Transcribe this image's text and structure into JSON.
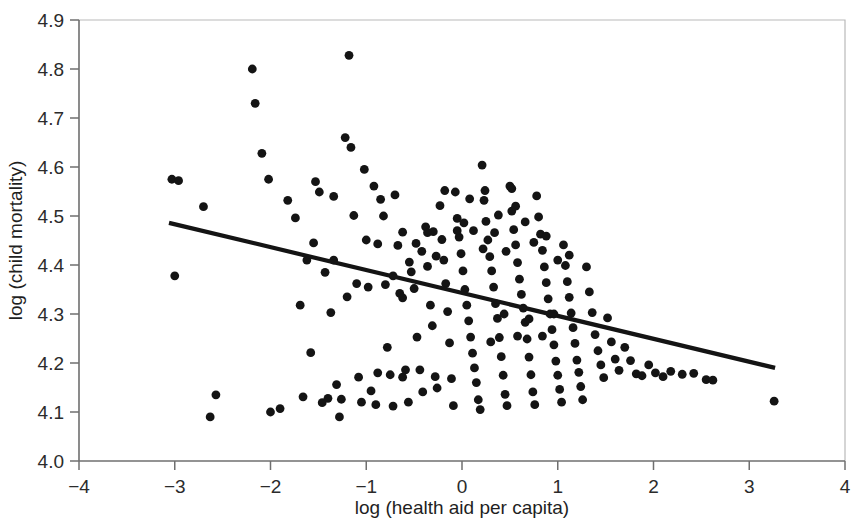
{
  "chart_data": {
    "type": "scatter",
    "title": "",
    "xlabel": "log (health aid per capita)",
    "ylabel": "log (child mortality)",
    "xlim": [
      -4,
      4
    ],
    "ylim": [
      4.0,
      4.9
    ],
    "xticks": [
      -4,
      -3,
      -2,
      -1,
      0,
      1,
      2,
      3,
      4
    ],
    "xtick_labels": [
      "−4",
      "−3",
      "−2",
      "−1",
      "0",
      "1",
      "2",
      "3",
      "4"
    ],
    "yticks": [
      4.0,
      4.1,
      4.2,
      4.3,
      4.4,
      4.5,
      4.6,
      4.7,
      4.8,
      4.9
    ],
    "ytick_labels": [
      "4.0",
      "4.1",
      "4.2",
      "4.3",
      "4.4",
      "4.5",
      "4.6",
      "4.7",
      "4.8",
      "4.9"
    ],
    "grid": false,
    "legend": null,
    "point_color": "#141414",
    "point_radius": 4.4,
    "fit_line": {
      "label": "linear fit",
      "color": "#141414",
      "x_start": -3.06,
      "y_start": 4.486,
      "x_end": 3.27,
      "y_end": 4.19,
      "slope": -0.0467,
      "intercept": 4.3432
    },
    "series": [
      {
        "name": "countries",
        "n_points": 196,
        "points": [
          [
            -3.03,
            4.575
          ],
          [
            -2.96,
            4.572
          ],
          [
            -3.0,
            4.378
          ],
          [
            -2.7,
            4.519
          ],
          [
            -2.63,
            4.09
          ],
          [
            -2.57,
            4.135
          ],
          [
            -2.19,
            4.8
          ],
          [
            -2.16,
            4.73
          ],
          [
            -2.09,
            4.628
          ],
          [
            -2.02,
            4.575
          ],
          [
            -2.0,
            4.1
          ],
          [
            -1.9,
            4.107
          ],
          [
            -1.82,
            4.532
          ],
          [
            -1.74,
            4.496
          ],
          [
            -1.69,
            4.318
          ],
          [
            -1.66,
            4.131
          ],
          [
            -1.62,
            4.41
          ],
          [
            -1.58,
            4.221
          ],
          [
            -1.53,
            4.57
          ],
          [
            -1.49,
            4.549
          ],
          [
            -1.46,
            4.119
          ],
          [
            -1.43,
            4.385
          ],
          [
            -1.4,
            4.128
          ],
          [
            -1.37,
            4.303
          ],
          [
            -1.34,
            4.54
          ],
          [
            -1.31,
            4.156
          ],
          [
            -1.28,
            4.09
          ],
          [
            -1.26,
            4.126
          ],
          [
            -1.22,
            4.66
          ],
          [
            -1.18,
            4.828
          ],
          [
            -1.16,
            4.64
          ],
          [
            -1.13,
            4.501
          ],
          [
            -1.1,
            4.362
          ],
          [
            -1.08,
            4.171
          ],
          [
            -1.05,
            4.12
          ],
          [
            -1.02,
            4.595
          ],
          [
            -1.0,
            4.451
          ],
          [
            -0.98,
            4.355
          ],
          [
            -0.95,
            4.143
          ],
          [
            -0.92,
            4.561
          ],
          [
            -0.9,
            4.115
          ],
          [
            -0.88,
            4.18
          ],
          [
            -0.85,
            4.534
          ],
          [
            -0.82,
            4.5
          ],
          [
            -0.8,
            4.36
          ],
          [
            -0.78,
            4.232
          ],
          [
            -0.75,
            4.176
          ],
          [
            -0.72,
            4.112
          ],
          [
            -0.7,
            4.543
          ],
          [
            -0.67,
            4.44
          ],
          [
            -0.65,
            4.342
          ],
          [
            -0.62,
            4.171
          ],
          [
            -0.59,
            4.186
          ],
          [
            -0.56,
            4.12
          ],
          [
            -0.53,
            4.386
          ],
          [
            -0.5,
            4.352
          ],
          [
            -0.47,
            4.253
          ],
          [
            -0.44,
            4.186
          ],
          [
            -0.41,
            4.141
          ],
          [
            -0.38,
            4.478
          ],
          [
            -0.36,
            4.397
          ],
          [
            -0.33,
            4.318
          ],
          [
            -0.31,
            4.276
          ],
          [
            -0.28,
            4.172
          ],
          [
            -0.26,
            4.149
          ],
          [
            -0.23,
            4.521
          ],
          [
            -0.21,
            4.452
          ],
          [
            -0.19,
            4.41
          ],
          [
            -0.17,
            4.362
          ],
          [
            -0.15,
            4.305
          ],
          [
            -0.13,
            4.241
          ],
          [
            -0.11,
            4.168
          ],
          [
            -0.09,
            4.113
          ],
          [
            -0.07,
            4.549
          ],
          [
            -0.05,
            4.495
          ],
          [
            -0.03,
            4.457
          ],
          [
            -0.01,
            4.423
          ],
          [
            0.01,
            4.388
          ],
          [
            0.03,
            4.35
          ],
          [
            0.05,
            4.318
          ],
          [
            0.07,
            4.286
          ],
          [
            0.09,
            4.253
          ],
          [
            0.11,
            4.22
          ],
          [
            0.13,
            4.19
          ],
          [
            0.15,
            4.16
          ],
          [
            0.17,
            4.125
          ],
          [
            0.19,
            4.105
          ],
          [
            0.21,
            4.604
          ],
          [
            0.23,
            4.532
          ],
          [
            0.25,
            4.489
          ],
          [
            0.27,
            4.451
          ],
          [
            0.29,
            4.417
          ],
          [
            0.31,
            4.388
          ],
          [
            0.33,
            4.355
          ],
          [
            0.35,
            4.321
          ],
          [
            0.37,
            4.291
          ],
          [
            0.39,
            4.252
          ],
          [
            0.41,
            4.213
          ],
          [
            0.43,
            4.175
          ],
          [
            0.45,
            4.136
          ],
          [
            0.47,
            4.113
          ],
          [
            0.5,
            4.561
          ],
          [
            0.52,
            4.51
          ],
          [
            0.54,
            4.472
          ],
          [
            0.56,
            4.441
          ],
          [
            0.58,
            4.405
          ],
          [
            0.6,
            4.371
          ],
          [
            0.62,
            4.34
          ],
          [
            0.64,
            4.312
          ],
          [
            0.66,
            4.283
          ],
          [
            0.68,
            4.249
          ],
          [
            0.7,
            4.212
          ],
          [
            0.72,
            4.176
          ],
          [
            0.74,
            4.141
          ],
          [
            0.76,
            4.115
          ],
          [
            0.78,
            4.541
          ],
          [
            0.8,
            4.498
          ],
          [
            0.82,
            4.463
          ],
          [
            0.84,
            4.43
          ],
          [
            0.86,
            4.396
          ],
          [
            0.88,
            4.364
          ],
          [
            0.9,
            4.331
          ],
          [
            0.92,
            4.3
          ],
          [
            0.94,
            4.268
          ],
          [
            0.96,
            4.237
          ],
          [
            0.98,
            4.204
          ],
          [
            1.0,
            4.175
          ],
          [
            1.02,
            4.146
          ],
          [
            1.04,
            4.12
          ],
          [
            1.06,
            4.441
          ],
          [
            1.08,
            4.399
          ],
          [
            1.1,
            4.366
          ],
          [
            1.12,
            4.334
          ],
          [
            1.14,
            4.302
          ],
          [
            1.16,
            4.272
          ],
          [
            1.18,
            4.24
          ],
          [
            1.2,
            4.206
          ],
          [
            1.22,
            4.181
          ],
          [
            1.24,
            4.152
          ],
          [
            1.26,
            4.125
          ],
          [
            1.3,
            4.396
          ],
          [
            1.33,
            4.345
          ],
          [
            1.36,
            4.303
          ],
          [
            1.39,
            4.258
          ],
          [
            1.42,
            4.225
          ],
          [
            1.45,
            4.196
          ],
          [
            1.48,
            4.17
          ],
          [
            1.52,
            4.292
          ],
          [
            1.56,
            4.243
          ],
          [
            1.6,
            4.208
          ],
          [
            1.64,
            4.185
          ],
          [
            1.7,
            4.232
          ],
          [
            1.76,
            4.205
          ],
          [
            1.82,
            4.178
          ],
          [
            1.88,
            4.174
          ],
          [
            1.95,
            4.196
          ],
          [
            2.02,
            4.18
          ],
          [
            2.1,
            4.172
          ],
          [
            2.18,
            4.183
          ],
          [
            2.3,
            4.177
          ],
          [
            2.42,
            4.179
          ],
          [
            2.55,
            4.166
          ],
          [
            2.62,
            4.165
          ],
          [
            3.26,
            4.122
          ],
          [
            -0.3,
            4.468
          ],
          [
            -0.27,
            4.418
          ],
          [
            0.02,
            4.486
          ],
          [
            0.12,
            4.47
          ],
          [
            0.22,
            4.433
          ],
          [
            0.34,
            4.466
          ],
          [
            0.46,
            4.428
          ],
          [
            0.56,
            4.52
          ],
          [
            0.66,
            4.488
          ],
          [
            -0.62,
            4.467
          ],
          [
            -0.55,
            4.406
          ],
          [
            -0.48,
            4.444
          ],
          [
            -0.42,
            4.428
          ],
          [
            -0.36,
            4.466
          ],
          [
            0.75,
            4.446
          ],
          [
            0.88,
            4.459
          ],
          [
            1.0,
            4.41
          ],
          [
            1.12,
            4.42
          ],
          [
            -0.18,
            4.552
          ],
          [
            -0.05,
            4.47
          ],
          [
            0.08,
            4.535
          ],
          [
            0.24,
            4.552
          ],
          [
            0.38,
            4.502
          ],
          [
            0.52,
            4.556
          ],
          [
            -0.88,
            4.443
          ],
          [
            -0.72,
            4.378
          ],
          [
            -0.62,
            4.333
          ],
          [
            -1.55,
            4.445
          ],
          [
            -1.34,
            4.41
          ],
          [
            -1.2,
            4.335
          ],
          [
            0.3,
            4.243
          ],
          [
            0.44,
            4.3
          ],
          [
            0.58,
            4.255
          ],
          [
            0.7,
            4.29
          ],
          [
            0.84,
            4.255
          ],
          [
            0.96,
            4.3
          ]
        ]
      }
    ]
  },
  "axes": {
    "x_axis_name": "x-axis",
    "y_axis_name": "y-axis"
  }
}
